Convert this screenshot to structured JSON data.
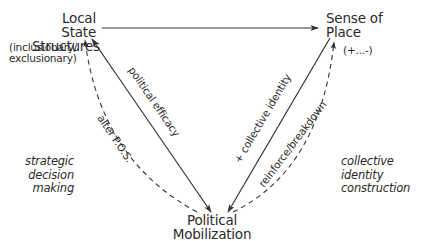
{
  "nodes": {
    "local_state": {
      "line1": "Local State",
      "line2": "Structures",
      "note_line1": "(inclusionary/",
      "note_line2": "exclusionary)"
    },
    "sense_of_place": {
      "line1": "Sense of",
      "line2": "Place",
      "note": "(+...-)"
    },
    "political_mobilization": {
      "line1": "Political",
      "line2": "Mobilization"
    }
  },
  "edges": {
    "political_efficacy": "political efficacy",
    "alter_pos": "alter P.O.S.",
    "collective_identity": "+ collective identity",
    "reinforce_breakdown": "reinforce/breakdown"
  },
  "side_labels": {
    "left": {
      "line1": "strategic",
      "line2": "decision",
      "line3": "making"
    },
    "right": {
      "line1": "collective",
      "line2": "identity",
      "line3": "construction"
    }
  },
  "colors": {
    "stroke": "#333333",
    "text": "#2b2b2b",
    "background": "#ffffff"
  }
}
